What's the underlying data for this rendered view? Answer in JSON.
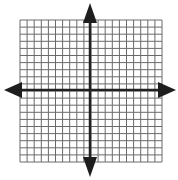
{
  "diagram": {
    "type": "coordinate-plane",
    "grid": {
      "x_start": 20,
      "y_start": 20,
      "cells_x": 20,
      "cells_y": 20,
      "cell_size": 7.1,
      "line_color": "#6a6a6a",
      "background": "#ffffff"
    },
    "axes": {
      "x_axis_y": 90,
      "y_axis_x": 90,
      "color": "#222222",
      "arrow_color": "#1e1e1e",
      "arrows": [
        "left",
        "right",
        "up",
        "down"
      ]
    }
  }
}
